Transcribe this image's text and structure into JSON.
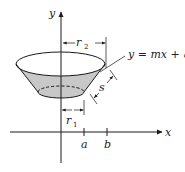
{
  "diagram": {
    "type": "frustum-surface-of-revolution",
    "axes": {
      "x_label": "x",
      "y_label": "y",
      "ticks": [
        {
          "label": "a"
        },
        {
          "label": "b"
        }
      ]
    },
    "dimensions": {
      "r2": {
        "base": "r",
        "sub": "2"
      },
      "r1": {
        "base": "r",
        "sub": "1"
      },
      "s": {
        "label": "s"
      }
    },
    "line_equation": "y = mx + q",
    "colors": {
      "shade": "#c8c8c8",
      "stroke": "#1a1a1a",
      "background": "#ffffff"
    }
  }
}
